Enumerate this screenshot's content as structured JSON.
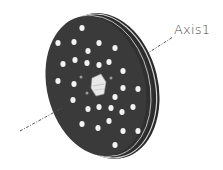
{
  "figure": {
    "axis_label": "Axis1",
    "colors": {
      "disk_face": "#3a3a3a",
      "disk_rim": "#2a2a2a",
      "rim_highlight": "#cfcfcf",
      "holes": "#f2f2f2",
      "hub": "#e6e6e6",
      "axis_line": "#555555",
      "background": "#ffffff"
    },
    "holes": [
      [
        82,
        28
      ],
      [
        58,
        43
      ],
      [
        74,
        42
      ],
      [
        99,
        43
      ],
      [
        115,
        48
      ],
      [
        88,
        51
      ],
      [
        63,
        64
      ],
      [
        75,
        60
      ],
      [
        87,
        63
      ],
      [
        99,
        65
      ],
      [
        109,
        62
      ],
      [
        123,
        71
      ],
      [
        58,
        81
      ],
      [
        74,
        84
      ],
      [
        112,
        79
      ],
      [
        123,
        88
      ],
      [
        138,
        89
      ],
      [
        73,
        100
      ],
      [
        115,
        97
      ],
      [
        88,
        109
      ],
      [
        99,
        107
      ],
      [
        111,
        108
      ],
      [
        122,
        112
      ],
      [
        133,
        107
      ],
      [
        82,
        124
      ],
      [
        98,
        128
      ],
      [
        109,
        121
      ],
      [
        123,
        131
      ],
      [
        138,
        131
      ],
      [
        115,
        145
      ]
    ],
    "small_holes": [
      [
        81,
        77
      ],
      [
        87,
        93
      ],
      [
        111,
        78
      ]
    ]
  }
}
